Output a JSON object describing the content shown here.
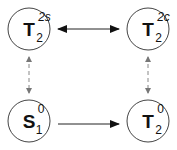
{
  "diagram": {
    "nodes": [
      {
        "id": "t2-2s",
        "base": "T",
        "sup": "2s",
        "sub": "2",
        "cx": 29,
        "cy": 29
      },
      {
        "id": "t2-2c",
        "base": "T",
        "sup": "2c",
        "sub": "2",
        "cx": 148,
        "cy": 29
      },
      {
        "id": "s1-0",
        "base": "S",
        "sup": "0",
        "sub": "1",
        "cx": 29,
        "cy": 121
      },
      {
        "id": "t2-0",
        "base": "T",
        "sup": "0",
        "sub": "2",
        "cx": 148,
        "cy": 121
      }
    ],
    "edges": [
      {
        "from": "t2-2s",
        "to": "t2-2c",
        "style": "solid",
        "direction": "bidirectional"
      },
      {
        "from": "t2-2s",
        "to": "s1-0",
        "style": "dashed",
        "direction": "bidirectional"
      },
      {
        "from": "t2-2c",
        "to": "t2-0",
        "style": "dashed",
        "direction": "bidirectional"
      },
      {
        "from": "s1-0",
        "to": "t2-0",
        "style": "solid",
        "direction": "forward"
      }
    ],
    "colors": {
      "node_stroke": "#444444",
      "solid_edge": "#222222",
      "dashed_edge": "#888888"
    }
  }
}
